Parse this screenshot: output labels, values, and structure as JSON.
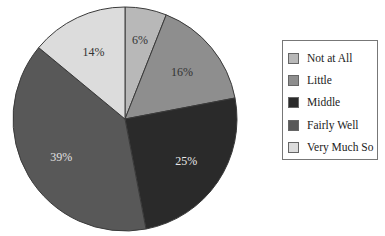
{
  "chart_data": {
    "type": "pie",
    "title": "",
    "start_angle_deg": 0,
    "direction": "clockwise",
    "legend_position": "right",
    "slices": [
      {
        "label": "Not at All",
        "value": 6,
        "display": "6%",
        "color": "#b8b8b8",
        "text_color": "#333333"
      },
      {
        "label": "Little",
        "value": 16,
        "display": "16%",
        "color": "#8e8e8e",
        "text_color": "#333333"
      },
      {
        "label": "Middle",
        "value": 25,
        "display": "25%",
        "color": "#2a2a2a",
        "text_color": "#e8e8e8"
      },
      {
        "label": "Fairly Well",
        "value": 39,
        "display": "39%",
        "color": "#585858",
        "text_color": "#e0e0e0"
      },
      {
        "label": "Very Much So",
        "value": 14,
        "display": "14%",
        "color": "#dcdcdc",
        "text_color": "#333333"
      }
    ]
  },
  "legend": {
    "items": [
      {
        "label": "Not at All",
        "color": "#b8b8b8"
      },
      {
        "label": "Little",
        "color": "#8e8e8e"
      },
      {
        "label": "Middle",
        "color": "#2a2a2a"
      },
      {
        "label": "Fairly Well",
        "color": "#585858"
      },
      {
        "label": "Very Much So",
        "color": "#dcdcdc"
      }
    ]
  }
}
